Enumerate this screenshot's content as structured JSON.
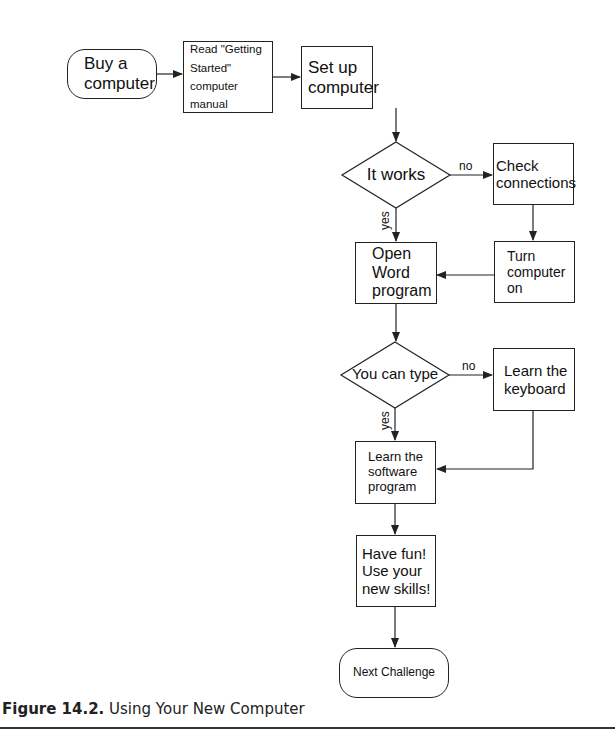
{
  "figure": {
    "caption_label": "Figure 14.2.",
    "caption_text": " Using Your New Computer"
  },
  "nodes": {
    "buy": {
      "label": "Buy a\ncomputer"
    },
    "read": {
      "label": "Read \"Getting\nStarted\" computer\nmanual"
    },
    "setup": {
      "label": "Set up\ncomputer"
    },
    "it_works": {
      "label": "It works"
    },
    "check": {
      "label": "Check\nconnections"
    },
    "turn_on": {
      "label": "Turn\ncomputer\non"
    },
    "open_word": {
      "label": "Open\nWord\nprogram"
    },
    "can_type": {
      "label": "You can type"
    },
    "learn_keyboard": {
      "label": "Learn the\nkeyboard"
    },
    "learn_software": {
      "label": "Learn the\nsoftware\nprogram"
    },
    "have_fun": {
      "label": "Have fun!\nUse your\nnew skills!"
    },
    "next": {
      "label": "Next Challenge"
    }
  },
  "edges": {
    "it_works_no": "no",
    "it_works_yes": "yes",
    "can_type_no": "no",
    "can_type_yes": "yes"
  }
}
